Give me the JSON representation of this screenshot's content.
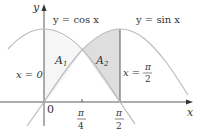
{
  "figure": {
    "curves": [
      {
        "name": "cos",
        "label": "y = cos x"
      },
      {
        "name": "sin",
        "label": "y = sin x"
      }
    ],
    "axes": {
      "x_label": "x",
      "y_label": "y",
      "origin_label": "0"
    },
    "ticks": {
      "pi_over_4": {
        "num": "π",
        "den": "4"
      },
      "pi_over_2": {
        "num": "π",
        "den": "2"
      }
    },
    "regions": [
      {
        "name": "A1",
        "main": "A",
        "sub": "1",
        "color": "#f6f6f6"
      },
      {
        "name": "A2",
        "main": "A",
        "sub": "2",
        "color": "#dedede"
      }
    ],
    "boundaries": {
      "left": "x = 0",
      "right_prefix": "x =",
      "right_num": "π",
      "right_den": "2"
    },
    "colors": {
      "axis": "#333333",
      "curve": "#bbbbbb",
      "line": "#555555"
    }
  }
}
